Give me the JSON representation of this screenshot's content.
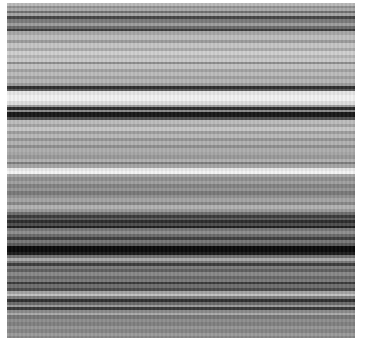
{
  "image": {
    "description": "Grayscale horizontal stripe texture",
    "background": "#ffffff",
    "bands": [
      {
        "h": 3,
        "c": "#b9b9b9"
      },
      {
        "h": 2,
        "c": "#8f8f8f"
      },
      {
        "h": 3,
        "c": "#a8a8a8"
      },
      {
        "h": 2,
        "c": "#6e6e6e"
      },
      {
        "h": 3,
        "c": "#a3a3a3"
      },
      {
        "h": 3,
        "c": "#454545"
      },
      {
        "h": 4,
        "c": "#7a7a7a"
      },
      {
        "h": 3,
        "c": "#9c9c9c"
      },
      {
        "h": 3,
        "c": "#6a6a6a"
      },
      {
        "h": 2,
        "c": "#3a3a3a"
      },
      {
        "h": 4,
        "c": "#a6a6a6"
      },
      {
        "h": 5,
        "c": "#bdbdbd"
      },
      {
        "h": 3,
        "c": "#9a9a9a"
      },
      {
        "h": 5,
        "c": "#c4c4c4"
      },
      {
        "h": 3,
        "c": "#a9a9a9"
      },
      {
        "h": 4,
        "c": "#cfcfcf"
      },
      {
        "h": 3,
        "c": "#b3b3b3"
      },
      {
        "h": 4,
        "c": "#c8c8c8"
      },
      {
        "h": 2,
        "c": "#8c8c8c"
      },
      {
        "h": 5,
        "c": "#c2c2c2"
      },
      {
        "h": 3,
        "c": "#a0a0a0"
      },
      {
        "h": 4,
        "c": "#bababa"
      },
      {
        "h": 3,
        "c": "#9e9e9e"
      },
      {
        "h": 4,
        "c": "#b5b5b5"
      },
      {
        "h": 3,
        "c": "#9a9a9a"
      },
      {
        "h": 3,
        "c": "#2f2f2f"
      },
      {
        "h": 2,
        "c": "#5a5a5a"
      },
      {
        "h": 4,
        "c": "#e4e4e4"
      },
      {
        "h": 6,
        "c": "#f0f0f0"
      },
      {
        "h": 4,
        "c": "#dcdcdc"
      },
      {
        "h": 2,
        "c": "#9a9a9a"
      },
      {
        "h": 3,
        "c": "#2a2a2a"
      },
      {
        "h": 2,
        "c": "#8a8a8a"
      },
      {
        "h": 5,
        "c": "#181818"
      },
      {
        "h": 3,
        "c": "#505050"
      },
      {
        "h": 4,
        "c": "#bcbcbc"
      },
      {
        "h": 3,
        "c": "#a2a2a2"
      },
      {
        "h": 4,
        "c": "#c6c6c6"
      },
      {
        "h": 3,
        "c": "#9c9c9c"
      },
      {
        "h": 4,
        "c": "#b8b8b8"
      },
      {
        "h": 3,
        "c": "#949494"
      },
      {
        "h": 4,
        "c": "#b1b1b1"
      },
      {
        "h": 3,
        "c": "#8e8e8e"
      },
      {
        "h": 4,
        "c": "#adadad"
      },
      {
        "h": 3,
        "c": "#a5a5a5"
      },
      {
        "h": 4,
        "c": "#989898"
      },
      {
        "h": 3,
        "c": "#b0b0b0"
      },
      {
        "h": 2,
        "c": "#7c7c7c"
      },
      {
        "h": 4,
        "c": "#a4a4a4"
      },
      {
        "h": 3,
        "c": "#e8e8e8"
      },
      {
        "h": 3,
        "c": "#f4f4f4"
      },
      {
        "h": 3,
        "c": "#a8a8a8"
      },
      {
        "h": 4,
        "c": "#8d8d8d"
      },
      {
        "h": 3,
        "c": "#9f9f9f"
      },
      {
        "h": 4,
        "c": "#818181"
      },
      {
        "h": 3,
        "c": "#959595"
      },
      {
        "h": 4,
        "c": "#787878"
      },
      {
        "h": 3,
        "c": "#8f8f8f"
      },
      {
        "h": 4,
        "c": "#a3a3a3"
      },
      {
        "h": 3,
        "c": "#868686"
      },
      {
        "h": 4,
        "c": "#b1b1b1"
      },
      {
        "h": 3,
        "c": "#999999"
      },
      {
        "h": 3,
        "c": "#6c6c6c"
      },
      {
        "h": 3,
        "c": "#3a3a3a"
      },
      {
        "h": 2,
        "c": "#5e5e5e"
      },
      {
        "h": 3,
        "c": "#2c2c2c"
      },
      {
        "h": 3,
        "c": "#4e4e4e"
      },
      {
        "h": 2,
        "c": "#1f1f1f"
      },
      {
        "h": 3,
        "c": "#777777"
      },
      {
        "h": 3,
        "c": "#8e8e8e"
      },
      {
        "h": 3,
        "c": "#6a6a6a"
      },
      {
        "h": 3,
        "c": "#3e3e3e"
      },
      {
        "h": 3,
        "c": "#777777"
      },
      {
        "h": 3,
        "c": "#595959"
      },
      {
        "h": 6,
        "c": "#0a0a0a"
      },
      {
        "h": 3,
        "c": "#1c1c1c"
      },
      {
        "h": 3,
        "c": "#6f6f6f"
      },
      {
        "h": 3,
        "c": "#a9a9a9"
      },
      {
        "h": 2,
        "c": "#787878"
      },
      {
        "h": 3,
        "c": "#3c3c3c"
      },
      {
        "h": 3,
        "c": "#7d7d7d"
      },
      {
        "h": 3,
        "c": "#5f5f5f"
      },
      {
        "h": 4,
        "c": "#878787"
      },
      {
        "h": 3,
        "c": "#666666"
      },
      {
        "h": 3,
        "c": "#7a7a7a"
      },
      {
        "h": 2,
        "c": "#3a3a3a"
      },
      {
        "h": 4,
        "c": "#6e6e6e"
      },
      {
        "h": 3,
        "c": "#4a4a4a"
      },
      {
        "h": 3,
        "c": "#a2a2a2"
      },
      {
        "h": 2,
        "c": "#c2c2c2"
      },
      {
        "h": 3,
        "c": "#7c7c7c"
      },
      {
        "h": 3,
        "c": "#2f2f2f"
      },
      {
        "h": 3,
        "c": "#6a6a6a"
      },
      {
        "h": 2,
        "c": "#999999"
      },
      {
        "h": 3,
        "c": "#383838"
      },
      {
        "h": 3,
        "c": "#8a8a8a"
      },
      {
        "h": 2,
        "c": "#aaaaaa"
      },
      {
        "h": 4,
        "c": "#767676"
      },
      {
        "h": 3,
        "c": "#8d8d8d"
      },
      {
        "h": 4,
        "c": "#7f7f7f"
      },
      {
        "h": 3,
        "c": "#959595"
      },
      {
        "h": 4,
        "c": "#848484"
      },
      {
        "h": 3,
        "c": "#9a9a9a"
      },
      {
        "h": 4,
        "c": "#868686"
      }
    ]
  }
}
